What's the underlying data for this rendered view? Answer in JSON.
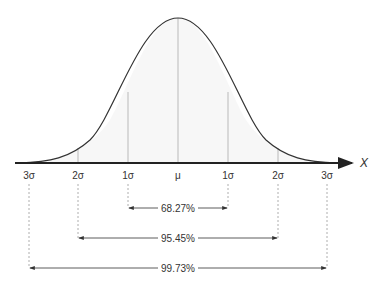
{
  "diagram": {
    "axis_label": "X",
    "tick_labels": [
      "3σ",
      "2σ",
      "1σ",
      "μ",
      "1σ",
      "2σ",
      "3σ"
    ],
    "intervals": [
      {
        "label": "68.27%",
        "range": "μ ± 1σ"
      },
      {
        "label": "95.45%",
        "range": "μ ± 2σ"
      },
      {
        "label": "99.73%",
        "range": "μ ± 3σ"
      }
    ],
    "colors": {
      "curve": "#333333",
      "axis": "#222222",
      "guides": "#999999",
      "text": "#333333"
    }
  }
}
